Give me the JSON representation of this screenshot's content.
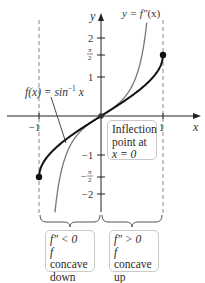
{
  "figure": {
    "function_label": "f(x) = sin⁻¹ x",
    "function_label_parts": {
      "lhs": "f(x) = sin",
      "sup": "−1",
      "rhs": " x"
    },
    "second_derivative_label": "y = f″(x)",
    "second_derivative_label_parts": {
      "lhs": "y = ",
      "f": "f″",
      "rhs": "(x)"
    },
    "axis_x_label": "x",
    "axis_y_label": "y",
    "x_ticks": [
      {
        "value": -1,
        "label": "−1"
      },
      {
        "value": 1,
        "label": "1"
      }
    ],
    "y_ticks": [
      {
        "value": 2,
        "label": "2"
      },
      {
        "value": 1.5708,
        "label_num": "π",
        "label_den": "2",
        "sign": ""
      },
      {
        "value": 1,
        "label": "1"
      },
      {
        "value": -1,
        "label": "−1"
      },
      {
        "value": -1.5708,
        "label_num": "π",
        "label_den": "2",
        "sign": "−"
      },
      {
        "value": -2,
        "label": "−2"
      }
    ],
    "inflection_box": {
      "line1": "Inflection",
      "line2": "point at",
      "line3": "x = 0"
    },
    "left_box": {
      "line1": "f″ < 0",
      "line2_italic": "f",
      "line2": " concave",
      "line3": "down"
    },
    "right_box": {
      "line1": "f″ > 0",
      "line2_italic": "f",
      "line2": " concave",
      "line3": "up"
    }
  },
  "colors": {
    "curve_f": "#111111",
    "curve_f2": "#777777",
    "axis": "#222222",
    "dashed": "#888888",
    "box_border": "#c9c9c9"
  },
  "chart_data": {
    "type": "line",
    "title": "",
    "xlabel": "x",
    "ylabel": "y",
    "xlim": [
      -1.6,
      1.6
    ],
    "ylim": [
      -2.5,
      2.6
    ],
    "grid": false,
    "series": [
      {
        "name": "f(x) = sin^-1 x",
        "x": [
          -1,
          -0.9,
          -0.75,
          -0.5,
          -0.25,
          0,
          0.25,
          0.5,
          0.75,
          0.9,
          1
        ],
        "y": [
          -1.5708,
          -1.1198,
          -0.8481,
          -0.5236,
          -0.2527,
          0,
          0.2527,
          0.5236,
          0.8481,
          1.1198,
          1.5708
        ]
      },
      {
        "name": "y = f''(x)",
        "x": [
          -0.77,
          -0.7,
          -0.6,
          -0.5,
          -0.3,
          0,
          0.3,
          0.5,
          0.6,
          0.7,
          0.77
        ],
        "y": [
          -2.88,
          -1.92,
          -1.17,
          -0.77,
          -0.35,
          0,
          0.35,
          0.77,
          1.17,
          1.92,
          2.88
        ]
      }
    ],
    "annotations": [
      "Inflection point at x = 0",
      "f'' < 0, f concave down (x < 0)",
      "f'' > 0, f concave up (x > 0)",
      "Endpoints (-1, -pi/2) and (1, pi/2)",
      "Dashed vertical lines at x = -1 and x = 1"
    ]
  }
}
